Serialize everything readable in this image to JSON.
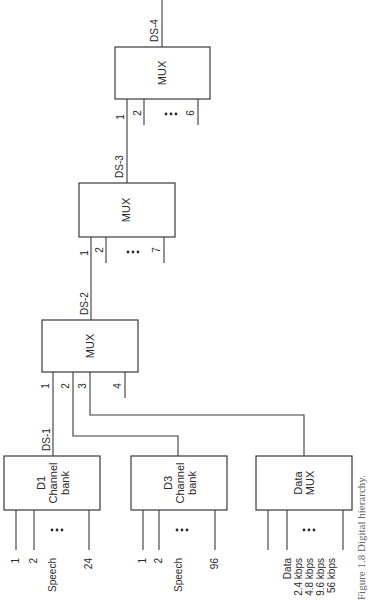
{
  "figure": {
    "caption": "Figure 1.8 Digital hierarchy.",
    "orientation": "rotated 90 degrees counter-clockwise"
  },
  "blocks": {
    "d1": {
      "line1": "D1",
      "line2": "Channel",
      "line3": "bank",
      "output": "DS-1",
      "inputs": [
        "1",
        "2",
        "24"
      ],
      "group_label": "Speech",
      "ellipsis": "•••"
    },
    "d3": {
      "line1": "D3",
      "line2": "Channel",
      "line3": "bank",
      "inputs": [
        "1",
        "2",
        "96"
      ],
      "group_label": "Speech",
      "ellipsis": "•••"
    },
    "data_mux": {
      "line1": "Data",
      "line2": "MUX",
      "inputs": [
        "Data",
        "2.4 kbps",
        "4.8 kbps",
        "9.6 kbps",
        "56 kbps"
      ],
      "ellipsis": "•••"
    },
    "mux_ds2": {
      "label": "MUX",
      "output": "DS-2",
      "inputs": [
        "1",
        "2",
        "3",
        "4"
      ]
    },
    "mux_ds3": {
      "label": "MUX",
      "output": "DS-3",
      "inputs": [
        "1",
        "2",
        "7"
      ],
      "ellipsis": "•••"
    },
    "mux_ds4": {
      "label": "MUX",
      "output": "DS-4",
      "inputs": [
        "1",
        "2",
        "6"
      ],
      "ellipsis": "•••"
    }
  }
}
